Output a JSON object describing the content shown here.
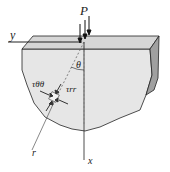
{
  "diagram": {
    "type": "stress-element-half-space",
    "labels": {
      "load": "P",
      "y_axis": "y",
      "x_axis": "x",
      "angle": "θ",
      "radial": "r",
      "tau_theta_theta": "τθθ",
      "tau_rr": "τrr"
    },
    "colors": {
      "body_fill": "#e6e6e6",
      "top_face": "#d2d2d2",
      "side_face": "#9a9a9a",
      "line": "#222222",
      "dashed": "#555555"
    }
  }
}
